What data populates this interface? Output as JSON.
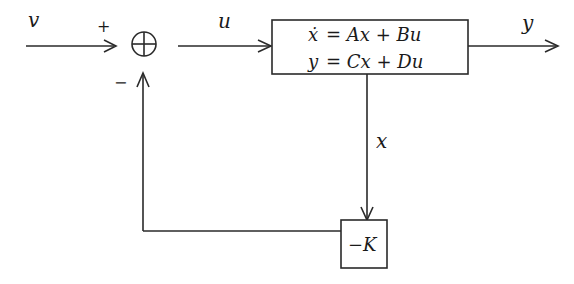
{
  "diagram": {
    "colors": {
      "stroke": "#2a2a2a",
      "text": "#1a1a1a",
      "background": "#ffffff"
    },
    "signals": {
      "input": "v",
      "control": "u",
      "output": "y",
      "state": "x"
    },
    "summing_junction": {
      "plus_sign": "+",
      "minus_sign": "−"
    },
    "plant": {
      "state_equation_lhs": "ẋ",
      "state_equation_rhs": "= Ax + Bu",
      "output_equation_lhs": "y",
      "output_equation_rhs": "= Cx + Du"
    },
    "feedback_gain": {
      "label": "−K"
    }
  }
}
